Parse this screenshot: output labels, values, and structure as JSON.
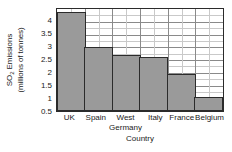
{
  "chart_data": {
    "type": "bar",
    "title": "",
    "categories": [
      "UK",
      "Spain",
      "West Germany",
      "Italy",
      "France",
      "Belgium"
    ],
    "category_lines": [
      [
        "UK",
        ""
      ],
      [
        "Spain",
        ""
      ],
      [
        "West",
        "Germany"
      ],
      [
        "Italy",
        ""
      ],
      [
        "France",
        ""
      ],
      [
        "Belgium",
        ""
      ]
    ],
    "values": [
      3.9,
      2.5,
      2.2,
      2.1,
      1.45,
      0.55
    ],
    "xlabel": "Country",
    "ylabel_line1": "SO",
    "ylabel_sub": "2",
    "ylabel_line1_rest": " Emissions",
    "ylabel_line2": "(millions of tonnes)",
    "ylim": [
      0,
      4
    ],
    "yticks": [
      0.5,
      1,
      1.5,
      2,
      2.5,
      3,
      3.5,
      4
    ],
    "ytick_labels": [
      "0.5",
      "1",
      "1.5",
      "2",
      "2.5",
      "3",
      "3.5",
      "4"
    ],
    "grid": true,
    "grid_minor_vertical_per_category": 2,
    "legend": "none",
    "bar_color": "#9a9a9a",
    "bar_border_color": "#2b2b2b",
    "grid_color": "#8a8a8a",
    "axis_color": "#2b2b2b",
    "text_color": "#1a1a1a"
  }
}
